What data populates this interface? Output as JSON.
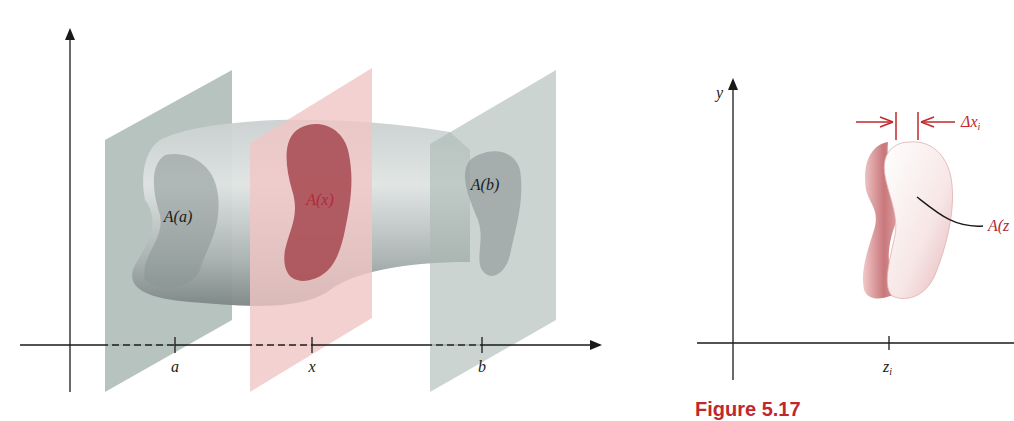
{
  "figure_left": {
    "title": "Volume by cross-sections",
    "section_labels": {
      "left": "A(a)",
      "middle": "A(x)",
      "right": "A(b)"
    },
    "axis_ticks": [
      "a",
      "x",
      "b"
    ],
    "colors": {
      "gray_plane": "#aab8b3",
      "red_plane": "#f0c6c4",
      "solid": "#9aa4a4",
      "red_section": "#a6474f",
      "label_red": "#b02a37",
      "axis": "#1a1a1a"
    }
  },
  "figure_right": {
    "y_axis_label": "y",
    "x_tick_label": "z_i",
    "x_tick_main": "z",
    "x_tick_sub": "i",
    "thickness_label_main": "Δx",
    "thickness_label_sub": "i",
    "area_label": "A(z",
    "colors": {
      "slab": "#d98b8e",
      "slab_face": "#f6e4e4",
      "annotation": "#c0282d"
    }
  },
  "caption": {
    "text": "Figure 5.17"
  }
}
